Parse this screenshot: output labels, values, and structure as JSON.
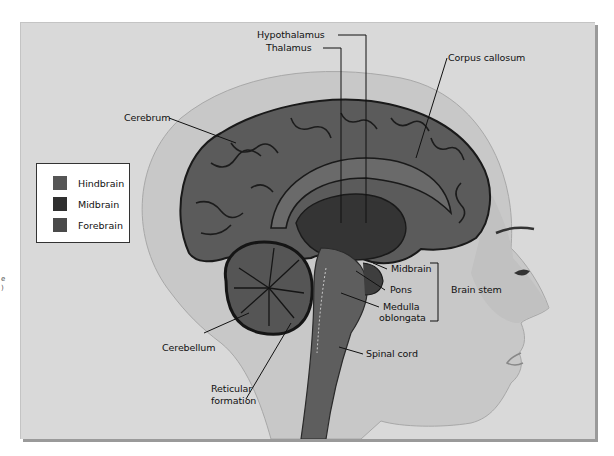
{
  "figure": {
    "colors": {
      "background": "#d9d9d9",
      "head_skin": "#c9c9c9",
      "forebrain": "#5f5f5f",
      "midbrain": "#3a3a3a",
      "hindbrain": "#555555",
      "outline": "#1c1c1c"
    }
  },
  "legend": {
    "items": [
      {
        "label": "Hindbrain",
        "color": "#555555"
      },
      {
        "label": "Midbrain",
        "color": "#2f2f2f"
      },
      {
        "label": "Forebrain",
        "color": "#4a4a4a"
      }
    ]
  },
  "labels": {
    "hypothalamus": "Hypothalamus",
    "thalamus": "Thalamus",
    "corpus_callosum": "Corpus callosum",
    "cerebrum": "Cerebrum",
    "midbrain": "Midbrain",
    "pons": "Pons",
    "medulla_1": "Medulla",
    "medulla_2": "oblongata",
    "brain_stem": "Brain stem",
    "cerebellum": "Cerebellum",
    "spinal_cord": "Spinal cord",
    "reticular_1": "Reticular",
    "reticular_2": "formation"
  },
  "edge_marks": {
    "left_1": "e",
    "left_2": ")"
  }
}
